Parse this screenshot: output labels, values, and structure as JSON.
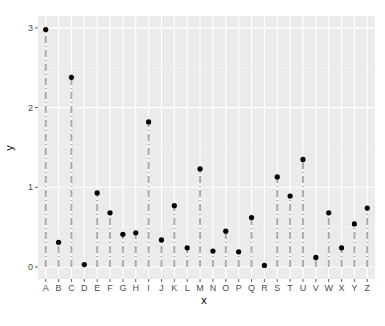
{
  "chart_data": {
    "type": "lollipop",
    "title": "",
    "xlabel": "x",
    "ylabel": "y",
    "categories": [
      "A",
      "B",
      "C",
      "D",
      "E",
      "F",
      "G",
      "H",
      "I",
      "J",
      "K",
      "L",
      "M",
      "N",
      "O",
      "P",
      "Q",
      "R",
      "S",
      "T",
      "U",
      "V",
      "W",
      "X",
      "Y",
      "Z"
    ],
    "values": [
      2.98,
      0.31,
      2.38,
      0.03,
      0.93,
      0.68,
      0.41,
      0.43,
      1.82,
      0.34,
      0.77,
      0.24,
      1.23,
      0.2,
      0.45,
      0.19,
      0.62,
      0.02,
      1.13,
      0.89,
      1.35,
      0.12,
      0.68,
      0.24,
      0.54,
      0.74
    ],
    "y_ticks": [
      0,
      1,
      2,
      3
    ],
    "y_tick_labels": [
      "0",
      "1",
      "2",
      "3"
    ],
    "ylim": [
      -0.15,
      3.1
    ],
    "grid": true,
    "legend": "none",
    "stem_style": "dotdash",
    "colors": {
      "panel_background": "#EBEBEB",
      "grid_major": "#FFFFFF",
      "grid_minor": "#F5F5F5",
      "stem": "#A6A6A6",
      "point": "#000000",
      "tick_label": "#4D4D4D",
      "tick_mark": "#333333"
    }
  }
}
